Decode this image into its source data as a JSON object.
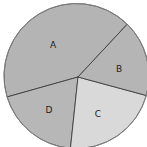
{
  "chart_data": {
    "type": "pie",
    "title": "",
    "categories": [
      "A",
      "B",
      "C",
      "D"
    ],
    "values": [
      42,
      19,
      22,
      17
    ],
    "colors": [
      "#b4b4b4",
      "#b7b7b7",
      "#d9d9d9",
      "#b5b5b5"
    ],
    "start_angle_deg": 45.6,
    "direction": "counterclockwise",
    "legend": "none",
    "labels_inside": true
  },
  "slices": [
    {
      "label": "A",
      "value": 42,
      "color": "#b4b4b4"
    },
    {
      "label": "B",
      "value": 19,
      "color": "#b7b7b7"
    },
    {
      "label": "C",
      "value": 22,
      "color": "#d9d9d9"
    },
    {
      "label": "D",
      "value": 17,
      "color": "#b5b5b5"
    }
  ],
  "stroke_color": "#333333"
}
